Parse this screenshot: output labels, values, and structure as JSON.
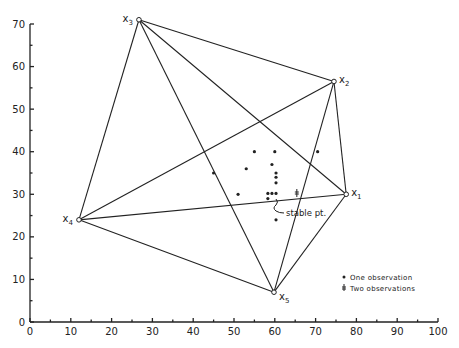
{
  "chart_data": {
    "type": "scatter",
    "title": "",
    "xlabel": "",
    "ylabel": "",
    "xlim": [
      0,
      100
    ],
    "ylim": [
      0,
      70
    ],
    "grid": false,
    "x_ticks": [
      0,
      10,
      20,
      30,
      40,
      50,
      60,
      70,
      80,
      90,
      100
    ],
    "x_tick_labels": [
      "0",
      "10",
      "20",
      "30",
      "40",
      "50",
      "60",
      "70",
      "80",
      "90",
      "100"
    ],
    "y_ticks": [
      0,
      10,
      20,
      30,
      40,
      50,
      60,
      70
    ],
    "y_tick_labels": [
      "0",
      "10",
      "20",
      "30",
      "40",
      "50",
      "60",
      "70"
    ],
    "vertices": [
      {
        "name": "X",
        "sub": "1",
        "x": 77.5,
        "y": 30
      },
      {
        "name": "X",
        "sub": "2",
        "x": 74.5,
        "y": 56.5
      },
      {
        "name": "X",
        "sub": "3",
        "x": 26.7,
        "y": 71
      },
      {
        "name": "X",
        "sub": "4",
        "x": 12,
        "y": 24
      },
      {
        "name": "X",
        "sub": "5",
        "x": 59.8,
        "y": 7
      }
    ],
    "edges": [
      [
        0,
        1
      ],
      [
        0,
        2
      ],
      [
        0,
        3
      ],
      [
        0,
        4
      ],
      [
        1,
        2
      ],
      [
        1,
        3
      ],
      [
        1,
        4
      ],
      [
        2,
        3
      ],
      [
        2,
        4
      ],
      [
        3,
        4
      ]
    ],
    "series": [
      {
        "name": "One observation",
        "marker": "dot",
        "points": [
          [
            55,
            40
          ],
          [
            60,
            40
          ],
          [
            70.5,
            40
          ],
          [
            53,
            36
          ],
          [
            59.3,
            37
          ],
          [
            45,
            35
          ],
          [
            60.3,
            35
          ],
          [
            60.3,
            34
          ],
          [
            60.3,
            32.7
          ],
          [
            51,
            30
          ],
          [
            58.3,
            30.2
          ],
          [
            59.3,
            30.2
          ],
          [
            60.3,
            30.2
          ],
          [
            58.3,
            29
          ],
          [
            60.3,
            24
          ]
        ]
      },
      {
        "name": "Two observations",
        "marker": "double-tick",
        "points": [
          [
            65.4,
            30.3
          ]
        ]
      }
    ],
    "annotations": [
      {
        "text": "stable pt.",
        "x": 60.3,
        "y": 29.5
      }
    ],
    "legend": {
      "position": "lower right",
      "entries": [
        "One observation",
        "Two observations"
      ]
    }
  },
  "labels": {
    "annotation": "stable pt.",
    "legend_one": "One observation",
    "legend_two": "Two observations",
    "x_letter": "X",
    "v1": "1",
    "v2": "2",
    "v3": "3",
    "v4": "4",
    "v5": "5",
    "xt": [
      "0",
      "10",
      "20",
      "30",
      "40",
      "50",
      "60",
      "70",
      "80",
      "90",
      "100"
    ],
    "yt": [
      "0",
      "10",
      "20",
      "30",
      "40",
      "50",
      "60",
      "70"
    ]
  }
}
